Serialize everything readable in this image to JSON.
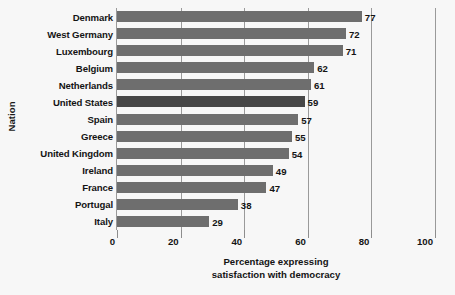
{
  "chart_data": {
    "type": "bar",
    "orientation": "horizontal",
    "title": "",
    "xlabel": "Percentage expressing satisfaction with democracy",
    "ylabel": "Nation",
    "xlim": [
      0,
      100
    ],
    "xticks": [
      0,
      20,
      40,
      60,
      80,
      100
    ],
    "grid": true,
    "gridlines_on": "x",
    "legend": null,
    "categories": [
      "Denmark",
      "West Germany",
      "Luxembourg",
      "Belgium",
      "Netherlands",
      "United States",
      "Spain",
      "Greece",
      "United Kingdom",
      "Ireland",
      "France",
      "Portugal",
      "Italy"
    ],
    "values": [
      77,
      72,
      71,
      62,
      61,
      59,
      57,
      55,
      54,
      49,
      47,
      38,
      29
    ],
    "data_labels": [
      "77",
      "72",
      "71",
      "62",
      "61",
      "59",
      "57",
      "55",
      "54",
      "49",
      "47",
      "38",
      "29"
    ],
    "highlighted_category": "United States",
    "colors": {
      "bar": "#6e6e6e",
      "bar_highlight": "#474747",
      "gridline": "#9a9a9a",
      "text": "#141414",
      "background": "#f7f7f7"
    }
  },
  "axis": {
    "y_title": "Nation",
    "x_title_line1": "Percentage expressing",
    "x_title_line2": "satisfaction with democracy",
    "x_tick_labels": [
      "0",
      "20",
      "40",
      "60",
      "80",
      "100"
    ]
  }
}
